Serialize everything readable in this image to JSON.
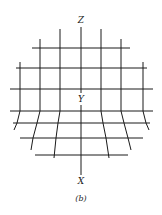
{
  "figure": {
    "caption": "(b)",
    "axes": {
      "top_label": "Z",
      "center_label": "Y",
      "bottom_label": "X"
    },
    "colors": {
      "line": "#1a1a1a",
      "background": "#ffffff"
    }
  }
}
